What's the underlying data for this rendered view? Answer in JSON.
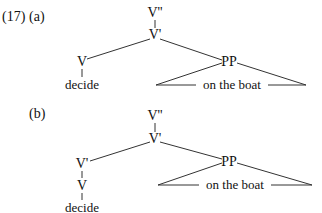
{
  "example": {
    "number": "(17)",
    "trees": [
      {
        "label": "(a)",
        "nodes": {
          "root": "V''",
          "vbar": "V'",
          "v": "V",
          "decide": "decide",
          "pp": "PP",
          "pp_content": "on the boat"
        }
      },
      {
        "label": "(b)",
        "nodes": {
          "root": "V''",
          "vbar": "V'",
          "vbar2": "V'",
          "v": "V",
          "decide": "decide",
          "pp": "PP",
          "pp_content": "on the boat"
        }
      }
    ]
  }
}
